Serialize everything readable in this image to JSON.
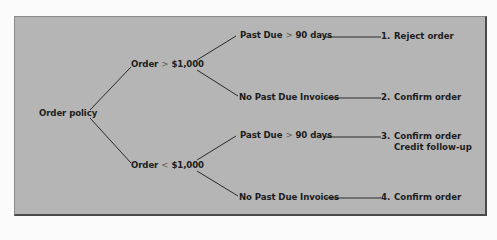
{
  "diagram": {
    "type": "decision-tree",
    "root": {
      "label": "Order policy"
    },
    "branches": [
      {
        "condition": {
          "subject": "Order",
          "operator": ">",
          "value": "$1,000"
        },
        "children": [
          {
            "condition": {
              "subject": "Past Due",
              "operator": ">",
              "value": "90 days"
            },
            "outcome": {
              "number": "1.",
              "action": "Reject order",
              "note": ""
            }
          },
          {
            "condition": {
              "label": "No Past Due Invoices"
            },
            "outcome": {
              "number": "2.",
              "action": "Confirm order",
              "note": ""
            }
          }
        ]
      },
      {
        "condition": {
          "subject": "Order",
          "operator": "<",
          "value": "$1,000"
        },
        "children": [
          {
            "condition": {
              "subject": "Past Due",
              "operator": ">",
              "value": "90 days"
            },
            "outcome": {
              "number": "3.",
              "action": "Confirm order",
              "note": "Credit follow-up"
            }
          },
          {
            "condition": {
              "label": "No Past Due Invoices"
            },
            "outcome": {
              "number": "4.",
              "action": "Confirm order",
              "note": ""
            }
          }
        ]
      }
    ]
  },
  "colors": {
    "panel_background": "#b5b5b5",
    "text": "#1c1c1c",
    "lines": "#2a2a2a",
    "page_background": "#fbfbfb"
  }
}
